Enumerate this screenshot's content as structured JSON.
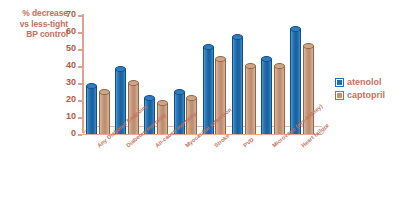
{
  "chart_data": {
    "type": "bar",
    "title": "% decrease vs less-tight BP control",
    "title_lines": [
      "% decrease",
      "vs less-tight",
      "BP control"
    ],
    "xlabel": "",
    "ylabel": "% decrease vs less-tight BP control",
    "ylim": [
      0,
      70
    ],
    "yticks": [
      0,
      10,
      20,
      30,
      40,
      50,
      60,
      70
    ],
    "ytick_labels": [
      "0",
      "10",
      "20",
      "30",
      "40",
      "50",
      "60",
      "70"
    ],
    "grid": false,
    "legend_position": "right",
    "categories": [
      "Any Diabetes Endpoint",
      "Diabetes mortality",
      "All-cause mortality",
      "Myocardial infarction",
      "Stroke",
      "PVD",
      "Microvasc (eye-kidney)",
      "Heart failure"
    ],
    "series": [
      {
        "name": "atenolol",
        "color": "#1f6fb5",
        "values": [
          28,
          38,
          21,
          25,
          51,
          57,
          44,
          62
        ]
      },
      {
        "name": "captopril",
        "color": "#c2946f",
        "values": [
          25,
          30,
          18,
          21,
          44,
          40,
          40,
          52
        ]
      }
    ]
  },
  "legend": {
    "items": [
      {
        "label": "atenolol",
        "key": "atenolol"
      },
      {
        "label": "captopril",
        "key": "captopril"
      }
    ]
  },
  "colors": {
    "atenolol": "#1f6fb5",
    "captopril": "#c2946f",
    "text": "#c4705e",
    "axis": "#d9a391",
    "background": "#ffffff"
  }
}
